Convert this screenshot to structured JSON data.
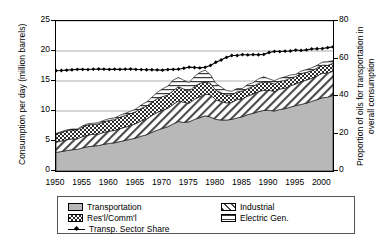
{
  "chart_data": {
    "type": "area",
    "title": "",
    "xlabel": "",
    "ylabel": "Consumption per day (million barrels)",
    "y2label_line1": "Proportion of oils for transportation in",
    "y2label_line2": "overall consumption",
    "grid": true,
    "legend_position": "below",
    "xlim": [
      1950,
      2002
    ],
    "ylim": [
      0,
      25
    ],
    "y2lim": [
      0,
      80
    ],
    "xticks": [
      1950,
      1955,
      1960,
      1965,
      1970,
      1975,
      1980,
      1985,
      1990,
      1995,
      2000
    ],
    "xtick_labels": [
      "1950",
      "1955",
      "1960",
      "1965",
      "1970",
      "1975",
      "1980",
      "1985",
      "1990",
      "1995",
      "2000"
    ],
    "yticks": [
      0,
      5,
      10,
      15,
      20,
      25
    ],
    "ytick_labels": [
      "0",
      "5",
      "10",
      "15",
      "20",
      "25"
    ],
    "y2ticks": [
      0,
      20,
      40,
      60,
      80
    ],
    "y2tick_labels": [
      "0",
      "20",
      "40",
      "60",
      "80"
    ],
    "x": [
      1950,
      1951,
      1952,
      1953,
      1954,
      1955,
      1956,
      1957,
      1958,
      1959,
      1960,
      1961,
      1962,
      1963,
      1964,
      1965,
      1966,
      1967,
      1968,
      1969,
      1970,
      1971,
      1972,
      1973,
      1974,
      1975,
      1976,
      1977,
      1978,
      1979,
      1980,
      1981,
      1982,
      1983,
      1984,
      1985,
      1986,
      1987,
      1988,
      1989,
      1990,
      1991,
      1992,
      1993,
      1994,
      1995,
      1996,
      1997,
      1998,
      1999,
      2000,
      2001,
      2002
    ],
    "series": [
      {
        "name": "Transportation",
        "pattern": "solid-gray",
        "color": "#b8b8b8",
        "values": [
          3.1,
          3.25,
          3.4,
          3.55,
          3.6,
          3.85,
          4.05,
          4.15,
          4.25,
          4.45,
          4.6,
          4.7,
          4.9,
          5.1,
          5.3,
          5.5,
          5.8,
          6.05,
          6.45,
          6.8,
          7.1,
          7.4,
          7.85,
          8.25,
          8.1,
          8.2,
          8.6,
          8.9,
          9.2,
          9.0,
          8.6,
          8.5,
          8.5,
          8.6,
          8.85,
          9.05,
          9.4,
          9.6,
          9.9,
          10.1,
          10.1,
          10.0,
          10.25,
          10.4,
          10.65,
          10.9,
          11.1,
          11.3,
          11.6,
          11.9,
          12.2,
          12.3,
          12.6
        ]
      },
      {
        "name": "Industrial",
        "pattern": "diagonal-hatch",
        "color": "#ffffff",
        "values": [
          1.7,
          1.75,
          1.8,
          1.8,
          1.75,
          1.9,
          1.95,
          1.95,
          1.9,
          2.0,
          2.05,
          2.05,
          2.15,
          2.2,
          2.3,
          2.4,
          2.55,
          2.6,
          2.8,
          2.95,
          3.05,
          3.05,
          3.25,
          3.45,
          3.35,
          3.1,
          3.35,
          3.5,
          3.6,
          3.7,
          3.25,
          3.1,
          2.85,
          2.85,
          3.05,
          3.0,
          3.1,
          3.2,
          3.35,
          3.35,
          3.35,
          3.25,
          3.4,
          3.4,
          3.55,
          3.6,
          3.8,
          3.85,
          3.85,
          3.95,
          4.1,
          4.0,
          4.05
        ]
      },
      {
        "name": "Res'l/Comm'l",
        "pattern": "checker",
        "color": "#888888",
        "values": [
          1.35,
          1.45,
          1.5,
          1.5,
          1.5,
          1.6,
          1.7,
          1.65,
          1.7,
          1.75,
          1.8,
          1.8,
          1.9,
          1.95,
          1.95,
          2.0,
          2.1,
          2.15,
          2.2,
          2.3,
          2.25,
          2.2,
          2.3,
          2.35,
          2.2,
          2.05,
          2.15,
          2.2,
          2.1,
          1.9,
          1.6,
          1.45,
          1.3,
          1.25,
          1.3,
          1.25,
          1.25,
          1.3,
          1.35,
          1.4,
          1.3,
          1.25,
          1.3,
          1.3,
          1.3,
          1.25,
          1.35,
          1.3,
          1.25,
          1.3,
          1.35,
          1.3,
          1.3
        ]
      },
      {
        "name": "Electric Gen.",
        "pattern": "horizontal-lines",
        "color": "#ffffff",
        "values": [
          0.1,
          0.12,
          0.13,
          0.14,
          0.15,
          0.17,
          0.18,
          0.2,
          0.22,
          0.25,
          0.28,
          0.3,
          0.33,
          0.36,
          0.4,
          0.45,
          0.55,
          0.7,
          0.85,
          1.05,
          1.3,
          1.5,
          1.75,
          1.55,
          1.45,
          1.4,
          1.65,
          1.85,
          1.9,
          1.45,
          1.15,
          0.95,
          0.75,
          0.6,
          0.55,
          0.45,
          0.7,
          0.6,
          0.75,
          0.85,
          0.6,
          0.55,
          0.5,
          0.6,
          0.5,
          0.35,
          0.4,
          0.45,
          0.5,
          0.45,
          0.5,
          0.6,
          0.45
        ]
      }
    ],
    "line_series": {
      "name": "Transp. Sector Share",
      "axis": "right",
      "unit": "%",
      "marker": "diamond",
      "values": [
        53.5,
        53.6,
        53.8,
        54.0,
        54.2,
        54.2,
        54.1,
        54.3,
        54.4,
        54.3,
        54.2,
        54.3,
        54.2,
        54.3,
        54.4,
        54.2,
        54.1,
        54.0,
        54.0,
        53.9,
        53.8,
        54.1,
        54.2,
        54.3,
        54.8,
        55.4,
        55.2,
        55.0,
        55.3,
        56.3,
        58.0,
        59.2,
        60.6,
        61.6,
        61.6,
        62.1,
        61.9,
        62.1,
        62.0,
        62.2,
        63.2,
        63.8,
        63.7,
        63.9,
        64.0,
        64.5,
        64.3,
        64.6,
        65.1,
        65.2,
        65.3,
        65.8,
        66.2
      ]
    }
  },
  "legend": {
    "items": [
      {
        "label": "Transportation",
        "swatch": "solid-gray"
      },
      {
        "label": "Res'l/Comm'l",
        "swatch": "checker"
      },
      {
        "label": "Transp. Sector Share",
        "swatch": "line-diamond"
      },
      {
        "label": "Industrial",
        "swatch": "diagonal-hatch"
      },
      {
        "label": "Electric Gen.",
        "swatch": "horizontal-lines"
      }
    ]
  }
}
